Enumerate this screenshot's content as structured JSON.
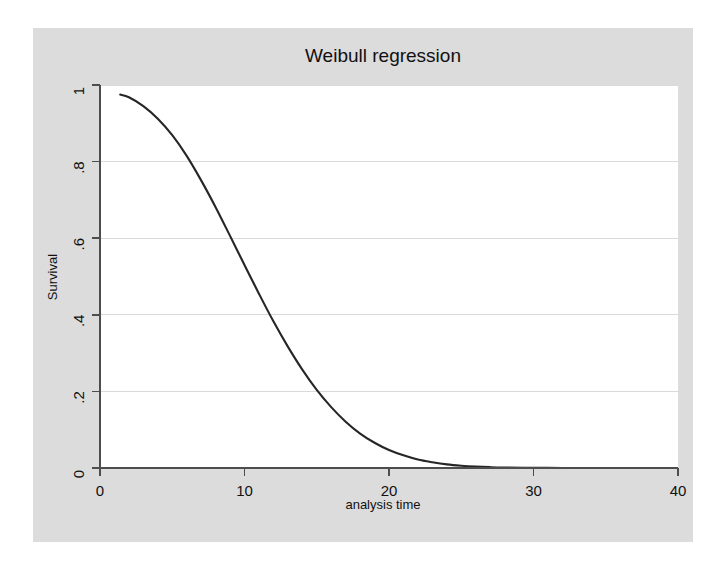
{
  "figure": {
    "title": "Weibull regression",
    "background_color": "#dcdcdc",
    "plot_background_color": "#ffffff",
    "curve_color": "#262626",
    "grid_color": "#d9d9d9",
    "axis_color": "#4d4d4d"
  },
  "chart_data": {
    "type": "line",
    "title": "Weibull regression",
    "xlabel": "analysis time",
    "ylabel": "Survival",
    "xlim": [
      0,
      40
    ],
    "ylim": [
      0,
      1
    ],
    "xticks": [
      0,
      10,
      20,
      30,
      40
    ],
    "xtick_labels": [
      "0",
      "10",
      "20",
      "30",
      "40"
    ],
    "yticks": [
      0,
      0.2,
      0.4,
      0.6,
      0.8,
      1
    ],
    "ytick_labels": [
      "0",
      ".2",
      ".4",
      ".6",
      ".8",
      "1"
    ],
    "grid": "horizontal",
    "legend": "none",
    "series": [
      {
        "name": "Weibull survival function",
        "x": [
          1.4,
          2,
          3,
          4,
          5,
          6,
          7,
          8,
          9,
          10,
          11,
          12,
          13,
          14,
          15,
          16,
          17,
          18,
          19,
          20,
          21,
          22,
          23,
          24,
          25,
          26,
          27,
          28,
          30,
          32,
          34,
          36,
          39
        ],
        "y": [
          0.975,
          0.968,
          0.945,
          0.912,
          0.869,
          0.815,
          0.751,
          0.681,
          0.606,
          0.53,
          0.455,
          0.383,
          0.317,
          0.257,
          0.204,
          0.159,
          0.121,
          0.09,
          0.066,
          0.047,
          0.033,
          0.022,
          0.015,
          0.0095,
          0.006,
          0.0037,
          0.0022,
          0.0013,
          0.0004,
          0.0001,
          3e-05,
          1e-05,
          2e-06
        ]
      }
    ]
  }
}
